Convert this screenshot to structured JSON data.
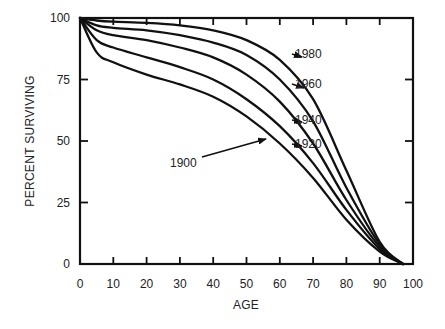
{
  "chart_data": {
    "type": "line",
    "title": "",
    "xlabel": "AGE",
    "ylabel": "PERCENT SURVIVING",
    "xlim": [
      0,
      100
    ],
    "ylim": [
      0,
      100
    ],
    "grid": false,
    "x_ticks": [
      0,
      10,
      20,
      30,
      40,
      50,
      60,
      70,
      80,
      90,
      100
    ],
    "y_ticks": [
      0,
      25,
      50,
      75,
      100
    ],
    "x": [
      0,
      5,
      10,
      20,
      30,
      40,
      50,
      60,
      70,
      80,
      90,
      97
    ],
    "series": [
      {
        "name": "1900",
        "values": [
          100,
          86,
          82,
          77,
          73,
          68,
          60,
          49,
          35,
          18,
          5,
          0
        ]
      },
      {
        "name": "1920",
        "values": [
          100,
          91,
          88,
          84,
          80,
          75,
          67,
          56,
          41,
          22,
          6,
          0
        ]
      },
      {
        "name": "1940",
        "values": [
          100,
          95,
          93,
          91,
          88,
          84,
          77,
          66,
          49,
          26,
          7,
          0
        ]
      },
      {
        "name": "1960",
        "values": [
          100,
          97,
          96,
          95,
          93,
          90,
          85,
          75,
          58,
          31,
          8,
          0
        ]
      },
      {
        "name": "1980",
        "values": [
          100,
          99,
          98.5,
          98,
          97,
          95,
          91,
          83,
          67,
          38,
          9,
          0
        ]
      }
    ],
    "annotations": [
      {
        "text": "1980",
        "label_pos": [
          295,
          58
        ],
        "arrow_to": [
          302,
          57
        ]
      },
      {
        "text": "1960",
        "label_pos": [
          295,
          88
        ],
        "arrow_to": [
          304,
          88
        ]
      },
      {
        "text": "1940",
        "label_pos": [
          295,
          124
        ],
        "arrow_to": [
          302,
          122
        ]
      },
      {
        "text": "1920",
        "label_pos": [
          295,
          148
        ],
        "arrow_to": [
          302,
          146
        ]
      },
      {
        "text": "1900",
        "label_pos": [
          170,
          167
        ],
        "arrow_to": [
          266,
          139
        ]
      }
    ],
    "legend_position": "inline-arrows",
    "colors": {
      "line": "#111111",
      "axis": "#111111",
      "text": "#222222",
      "background": "#ffffff"
    }
  }
}
